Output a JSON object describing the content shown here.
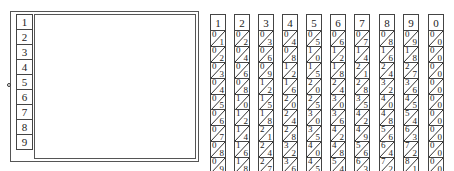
{
  "board": {
    "index_labels": [
      "1",
      "2",
      "3",
      "4",
      "5",
      "6",
      "7",
      "8",
      "9"
    ]
  },
  "rods": [
    {
      "head": "1",
      "x": 210,
      "cells": [
        [
          "0",
          "1"
        ],
        [
          "0",
          "2"
        ],
        [
          "0",
          "3"
        ],
        [
          "0",
          "4"
        ],
        [
          "0",
          "5"
        ],
        [
          "0",
          "6"
        ],
        [
          "0",
          "7"
        ],
        [
          "0",
          "8"
        ],
        [
          "0",
          "9"
        ]
      ]
    },
    {
      "head": "2",
      "x": 234,
      "cells": [
        [
          "0",
          "2"
        ],
        [
          "0",
          "4"
        ],
        [
          "0",
          "6"
        ],
        [
          "0",
          "8"
        ],
        [
          "1",
          "0"
        ],
        [
          "1",
          "2"
        ],
        [
          "1",
          "4"
        ],
        [
          "1",
          "6"
        ],
        [
          "1",
          "8"
        ]
      ]
    },
    {
      "head": "3",
      "x": 258,
      "cells": [
        [
          "0",
          "3"
        ],
        [
          "0",
          "6"
        ],
        [
          "0",
          "9"
        ],
        [
          "1",
          "2"
        ],
        [
          "1",
          "5"
        ],
        [
          "1",
          "8"
        ],
        [
          "2",
          "1"
        ],
        [
          "2",
          "4"
        ],
        [
          "2",
          "7"
        ]
      ]
    },
    {
      "head": "4",
      "x": 282,
      "cells": [
        [
          "0",
          "4"
        ],
        [
          "0",
          "8"
        ],
        [
          "1",
          "2"
        ],
        [
          "1",
          "6"
        ],
        [
          "2",
          "0"
        ],
        [
          "2",
          "4"
        ],
        [
          "2",
          "8"
        ],
        [
          "3",
          "2"
        ],
        [
          "3",
          "6"
        ]
      ]
    },
    {
      "head": "5",
      "x": 306,
      "cells": [
        [
          "0",
          "5"
        ],
        [
          "1",
          "0"
        ],
        [
          "1",
          "5"
        ],
        [
          "2",
          "0"
        ],
        [
          "2",
          "5"
        ],
        [
          "3",
          "0"
        ],
        [
          "3",
          "5"
        ],
        [
          "4",
          "0"
        ],
        [
          "4",
          "5"
        ]
      ]
    },
    {
      "head": "6",
      "x": 330,
      "cells": [
        [
          "0",
          "6"
        ],
        [
          "1",
          "2"
        ],
        [
          "1",
          "8"
        ],
        [
          "2",
          "4"
        ],
        [
          "3",
          "0"
        ],
        [
          "3",
          "6"
        ],
        [
          "4",
          "2"
        ],
        [
          "4",
          "8"
        ],
        [
          "5",
          "4"
        ]
      ]
    },
    {
      "head": "7",
      "x": 354,
      "cells": [
        [
          "0",
          "7"
        ],
        [
          "1",
          "4"
        ],
        [
          "2",
          "1"
        ],
        [
          "2",
          "8"
        ],
        [
          "3",
          "5"
        ],
        [
          "4",
          "2"
        ],
        [
          "4",
          "9"
        ],
        [
          "5",
          "6"
        ],
        [
          "6",
          "3"
        ]
      ]
    },
    {
      "head": "8",
      "x": 379,
      "cells": [
        [
          "0",
          "8"
        ],
        [
          "1",
          "6"
        ],
        [
          "2",
          "4"
        ],
        [
          "3",
          "2"
        ],
        [
          "4",
          "0"
        ],
        [
          "4",
          "8"
        ],
        [
          "5",
          "6"
        ],
        [
          "6",
          "4"
        ],
        [
          "7",
          "2"
        ]
      ]
    },
    {
      "head": "9",
      "x": 403,
      "cells": [
        [
          "0",
          "9"
        ],
        [
          "1",
          "8"
        ],
        [
          "2",
          "7"
        ],
        [
          "3",
          "6"
        ],
        [
          "4",
          "5"
        ],
        [
          "5",
          "4"
        ],
        [
          "6",
          "3"
        ],
        [
          "7",
          "2"
        ],
        [
          "8",
          "1"
        ]
      ]
    },
    {
      "head": "0",
      "x": 428,
      "cells": [
        [
          "0",
          "0"
        ],
        [
          "0",
          "0"
        ],
        [
          "0",
          "0"
        ],
        [
          "0",
          "0"
        ],
        [
          "0",
          "0"
        ],
        [
          "0",
          "0"
        ],
        [
          "0",
          "0"
        ],
        [
          "0",
          "0"
        ],
        [
          "0",
          "0"
        ]
      ]
    }
  ]
}
